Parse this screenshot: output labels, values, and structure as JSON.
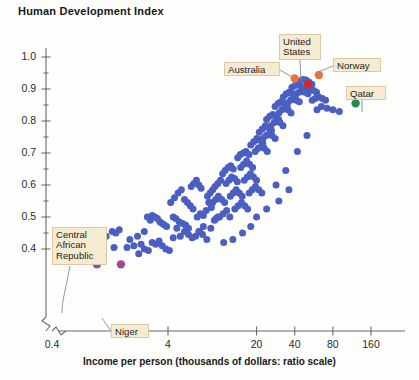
{
  "chart_data": {
    "type": "scatter",
    "title": "Human Development Index",
    "xlabel": "Income per person (thousands of dollars: ratio scale)",
    "ylabel": "Human Development Index",
    "xscale": "log",
    "x_tick_labels": [
      "0.4",
      "4",
      "20",
      "40",
      "80",
      "160"
    ],
    "x_ticks": [
      0.4,
      4,
      20,
      40,
      80,
      160
    ],
    "y_tick_labels": [
      "0.4",
      "0.5",
      "0.6",
      "0.7",
      "0.8",
      "0.9",
      "1.0"
    ],
    "y_ticks": [
      0.4,
      0.5,
      0.6,
      0.7,
      0.8,
      0.9,
      1.0
    ],
    "ylim": [
      0.34,
      1.04
    ],
    "grid": false,
    "legend": "none",
    "axis_break": true,
    "point_color": "#4a5fc1",
    "series": [
      {
        "name": "Countries",
        "color": "#4a5fc1",
        "points": [
          [
            1.1,
            0.352
          ],
          [
            1.7,
            0.352
          ],
          [
            1.3,
            0.44
          ],
          [
            1.45,
            0.455
          ],
          [
            1.55,
            0.45
          ],
          [
            1.65,
            0.46
          ],
          [
            1.5,
            0.405
          ],
          [
            1.9,
            0.405
          ],
          [
            2.0,
            0.43
          ],
          [
            2.15,
            0.41
          ],
          [
            2.3,
            0.44
          ],
          [
            2.45,
            0.415
          ],
          [
            2.6,
            0.455
          ],
          [
            2.75,
            0.5
          ],
          [
            2.9,
            0.49
          ],
          [
            3.0,
            0.505
          ],
          [
            3.15,
            0.5
          ],
          [
            3.3,
            0.495
          ],
          [
            3.45,
            0.485
          ],
          [
            3.6,
            0.48
          ],
          [
            3.75,
            0.475
          ],
          [
            3.9,
            0.47
          ],
          [
            2.35,
            0.385
          ],
          [
            2.6,
            0.4
          ],
          [
            2.8,
            0.395
          ],
          [
            3.0,
            0.42
          ],
          [
            3.2,
            0.415
          ],
          [
            3.4,
            0.425
          ],
          [
            3.6,
            0.41
          ],
          [
            3.85,
            0.4
          ],
          [
            4.1,
            0.395
          ],
          [
            4.4,
            0.435
          ],
          [
            4.7,
            0.465
          ],
          [
            4.4,
            0.5
          ],
          [
            4.6,
            0.495
          ],
          [
            4.9,
            0.485
          ],
          [
            5.2,
            0.48
          ],
          [
            5.5,
            0.475
          ],
          [
            5.8,
            0.465
          ],
          [
            4.2,
            0.545
          ],
          [
            4.5,
            0.56
          ],
          [
            4.8,
            0.575
          ],
          [
            5.1,
            0.585
          ],
          [
            5.4,
            0.555
          ],
          [
            5.7,
            0.545
          ],
          [
            6.0,
            0.535
          ],
          [
            6.3,
            0.525
          ],
          [
            6.1,
            0.595
          ],
          [
            6.4,
            0.605
          ],
          [
            6.7,
            0.615
          ],
          [
            7.0,
            0.6
          ],
          [
            7.3,
            0.59
          ],
          [
            5.0,
            0.44
          ],
          [
            5.4,
            0.455
          ],
          [
            5.8,
            0.445
          ],
          [
            6.2,
            0.435
          ],
          [
            6.6,
            0.44
          ],
          [
            7.1,
            0.455
          ],
          [
            7.6,
            0.47
          ],
          [
            6.8,
            0.5
          ],
          [
            7.2,
            0.51
          ],
          [
            7.6,
            0.505
          ],
          [
            8.0,
            0.52
          ],
          [
            8.4,
            0.545
          ],
          [
            8.8,
            0.53
          ],
          [
            7.0,
            0.455
          ],
          [
            7.5,
            0.445
          ],
          [
            8.1,
            0.43
          ],
          [
            8.7,
            0.465
          ],
          [
            9.3,
            0.49
          ],
          [
            9.9,
            0.5
          ],
          [
            8.2,
            0.565
          ],
          [
            8.6,
            0.575
          ],
          [
            9.0,
            0.585
          ],
          [
            9.4,
            0.595
          ],
          [
            9.9,
            0.605
          ],
          [
            10.4,
            0.615
          ],
          [
            9.0,
            0.545
          ],
          [
            9.5,
            0.555
          ],
          [
            10.0,
            0.565
          ],
          [
            10.6,
            0.555
          ],
          [
            11.2,
            0.545
          ],
          [
            9.6,
            0.495
          ],
          [
            10.2,
            0.5
          ],
          [
            10.9,
            0.51
          ],
          [
            11.6,
            0.52
          ],
          [
            12.3,
            0.5
          ],
          [
            10.8,
            0.635
          ],
          [
            11.3,
            0.645
          ],
          [
            11.9,
            0.655
          ],
          [
            12.5,
            0.66
          ],
          [
            13.1,
            0.65
          ],
          [
            11.5,
            0.605
          ],
          [
            12.1,
            0.615
          ],
          [
            12.7,
            0.625
          ],
          [
            13.4,
            0.62
          ],
          [
            14.1,
            0.61
          ],
          [
            12.4,
            0.565
          ],
          [
            13.1,
            0.575
          ],
          [
            13.8,
            0.585
          ],
          [
            14.6,
            0.575
          ],
          [
            15.4,
            0.565
          ],
          [
            13.5,
            0.525
          ],
          [
            14.3,
            0.535
          ],
          [
            15.2,
            0.545
          ],
          [
            16.1,
            0.535
          ],
          [
            17.0,
            0.525
          ],
          [
            14.2,
            0.685
          ],
          [
            14.9,
            0.695
          ],
          [
            15.7,
            0.7
          ],
          [
            16.5,
            0.705
          ],
          [
            17.4,
            0.695
          ],
          [
            15.0,
            0.655
          ],
          [
            15.8,
            0.665
          ],
          [
            16.7,
            0.675
          ],
          [
            17.6,
            0.665
          ],
          [
            18.6,
            0.655
          ],
          [
            16.0,
            0.615
          ],
          [
            16.9,
            0.625
          ],
          [
            17.9,
            0.635
          ],
          [
            18.9,
            0.625
          ],
          [
            20.0,
            0.615
          ],
          [
            17.5,
            0.575
          ],
          [
            18.5,
            0.585
          ],
          [
            19.6,
            0.595
          ],
          [
            20.8,
            0.585
          ],
          [
            22.0,
            0.575
          ],
          [
            18.0,
            0.725
          ],
          [
            19.0,
            0.735
          ],
          [
            20.1,
            0.745
          ],
          [
            21.2,
            0.74
          ],
          [
            22.4,
            0.73
          ],
          [
            19.5,
            0.705
          ],
          [
            20.6,
            0.715
          ],
          [
            21.8,
            0.72
          ],
          [
            23.0,
            0.715
          ],
          [
            24.3,
            0.705
          ],
          [
            21.0,
            0.765
          ],
          [
            22.2,
            0.775
          ],
          [
            23.5,
            0.785
          ],
          [
            24.8,
            0.78
          ],
          [
            26.2,
            0.77
          ],
          [
            22.5,
            0.745
          ],
          [
            23.8,
            0.755
          ],
          [
            25.1,
            0.76
          ],
          [
            26.5,
            0.755
          ],
          [
            28.0,
            0.745
          ],
          [
            24.0,
            0.805
          ],
          [
            25.4,
            0.815
          ],
          [
            26.8,
            0.82
          ],
          [
            28.3,
            0.815
          ],
          [
            29.9,
            0.805
          ],
          [
            26.0,
            0.785
          ],
          [
            27.5,
            0.795
          ],
          [
            29.0,
            0.8
          ],
          [
            30.6,
            0.795
          ],
          [
            32.3,
            0.785
          ],
          [
            28.0,
            0.845
          ],
          [
            29.6,
            0.855
          ],
          [
            31.2,
            0.86
          ],
          [
            33.0,
            0.855
          ],
          [
            34.8,
            0.845
          ],
          [
            30.0,
            0.825
          ],
          [
            31.7,
            0.835
          ],
          [
            33.5,
            0.84
          ],
          [
            35.4,
            0.835
          ],
          [
            37.4,
            0.825
          ],
          [
            32.5,
            0.875
          ],
          [
            34.3,
            0.885
          ],
          [
            36.2,
            0.89
          ],
          [
            38.2,
            0.885
          ],
          [
            40.3,
            0.88
          ],
          [
            35.0,
            0.855
          ],
          [
            37.0,
            0.865
          ],
          [
            39.0,
            0.87
          ],
          [
            41.2,
            0.865
          ],
          [
            43.5,
            0.86
          ],
          [
            38.0,
            0.905
          ],
          [
            40.1,
            0.91
          ],
          [
            42.3,
            0.915
          ],
          [
            44.6,
            0.91
          ],
          [
            47.1,
            0.905
          ],
          [
            41.0,
            0.885
          ],
          [
            43.3,
            0.89
          ],
          [
            45.7,
            0.895
          ],
          [
            48.2,
            0.89
          ],
          [
            50.9,
            0.885
          ],
          [
            44.0,
            0.925
          ],
          [
            46.4,
            0.93
          ],
          [
            49.0,
            0.928
          ],
          [
            51.7,
            0.922
          ],
          [
            54.6,
            0.915
          ],
          [
            48.0,
            0.9
          ],
          [
            50.7,
            0.905
          ],
          [
            53.5,
            0.9
          ],
          [
            56.4,
            0.895
          ],
          [
            59.5,
            0.89
          ],
          [
            55.0,
            0.865
          ],
          [
            58.0,
            0.87
          ],
          [
            62.0,
            0.875
          ],
          [
            66.0,
            0.87
          ],
          [
            70.0,
            0.865
          ],
          [
            60.0,
            0.835
          ],
          [
            65.0,
            0.845
          ],
          [
            72.0,
            0.84
          ],
          [
            80.0,
            0.835
          ],
          [
            90.0,
            0.83
          ],
          [
            34.0,
            0.645
          ],
          [
            42.0,
            0.705
          ],
          [
            50.0,
            0.755
          ],
          [
            28.5,
            0.6
          ],
          [
            20.0,
            0.5
          ],
          [
            24.0,
            0.525
          ],
          [
            30.0,
            0.55
          ],
          [
            36.0,
            0.585
          ],
          [
            11.0,
            0.42
          ],
          [
            13.0,
            0.43
          ],
          [
            15.5,
            0.45
          ],
          [
            18.0,
            0.47
          ]
        ]
      }
    ],
    "highlights": [
      {
        "name": "Australia",
        "x": 40.0,
        "y": 0.933,
        "color": "#e8743b"
      },
      {
        "name": "Norway",
        "x": 62.0,
        "y": 0.944,
        "color": "#e8743b"
      },
      {
        "name": "United States",
        "x": 51.0,
        "y": 0.915,
        "color": "#d8232a"
      },
      {
        "name": "Qatar",
        "x": 121.0,
        "y": 0.855,
        "color": "#1f8a4c"
      },
      {
        "name": "Central African Republic",
        "x": 1.1,
        "y": 0.352,
        "color": "#9b4d9b"
      },
      {
        "name": "Niger",
        "x": 1.7,
        "y": 0.352,
        "color": "#9b4d9b"
      }
    ],
    "annotations": [
      {
        "label": "Australia",
        "box": [
          224,
          62,
          56,
          14
        ]
      },
      {
        "label": "United\nStates",
        "box": [
          279,
          34,
          42,
          26
        ]
      },
      {
        "label": "Norway",
        "box": [
          333,
          58,
          48,
          14
        ]
      },
      {
        "label": "Qatar",
        "box": [
          346,
          86,
          40,
          14
        ]
      },
      {
        "label": "Central\nAfrican\nRepublic",
        "box": [
          52,
          227,
          55,
          38
        ]
      },
      {
        "label": "Niger",
        "box": [
          111,
          324,
          38,
          14
        ]
      }
    ]
  }
}
